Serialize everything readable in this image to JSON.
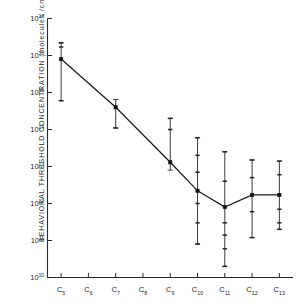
{
  "chart_data": {
    "type": "line",
    "title": "",
    "xlabel": "",
    "ylabel": "BEHAVIORAL THRESHOLD CONCENTRATION  (molecules /cm",
    "ylabel_sup": "3",
    "ylabel_close": ")",
    "grid": false,
    "legend": null,
    "yscale": "log",
    "ylim": [
      10000000000.0,
      1e+17
    ],
    "ytick_labels": [
      "10",
      "10",
      "10",
      "10",
      "10",
      "10",
      "10",
      "10"
    ],
    "ytick_exponents": [
      "17",
      "16",
      "15",
      "14",
      "13",
      "12",
      "11",
      "10"
    ],
    "ytick_values": [
      1e+17,
      1e+16,
      1000000000000000.0,
      100000000000000.0,
      10000000000000.0,
      1000000000000.0,
      100000000000.0,
      10000000000.0
    ],
    "categories": [
      "C",
      "C",
      "C",
      "C",
      "C",
      "C",
      "C",
      "C",
      "C"
    ],
    "category_subscripts": [
      "5",
      "6",
      "7",
      "8",
      "9",
      "10",
      "11",
      "12",
      "13"
    ],
    "category_labels": [
      "C5",
      "C6",
      "C7",
      "8",
      "C9",
      "C10",
      "C11",
      "C12",
      "C13"
    ],
    "series": [
      {
        "name": "behavioral threshold",
        "marker": "square",
        "color": "#1a1a1a",
        "points": [
          {
            "x": "C5",
            "y": 8000000000000000.0,
            "err_low": 600000000000000.0,
            "err_high": 2.2e+16,
            "has_marker": true,
            "ticks": [
              8000000000000000.0,
              1.7e+16,
              2.2e+16,
              600000000000000.0
            ]
          },
          {
            "x": "C6",
            "y": null,
            "err_low": null,
            "err_high": null,
            "has_marker": false,
            "ticks": []
          },
          {
            "x": "C7",
            "y": 400000000000000.0,
            "err_low": 110000000000000.0,
            "err_high": 650000000000000.0,
            "has_marker": true,
            "ticks": [
              400000000000000.0,
              110000000000000.0
            ]
          },
          {
            "x": "C8",
            "y": null,
            "err_low": null,
            "err_high": null,
            "has_marker": false,
            "ticks": []
          },
          {
            "x": "C9",
            "y": 13000000000000.0,
            "err_low": 8000000000000.0,
            "err_high": 200000000000000.0,
            "has_marker": true,
            "ticks": [
              13000000000000.0,
              100000000000000.0,
              200000000000000.0
            ]
          },
          {
            "x": "C10",
            "y": 2200000000000.0,
            "err_low": 80000000000.0,
            "err_high": 60000000000000.0,
            "has_marker": true,
            "ticks": [
              2200000000000.0,
              60000000000000.0,
              20000000000000.0,
              7000000000000.0,
              1000000000000.0,
              300000000000.0,
              80000000000.0
            ]
          },
          {
            "x": "C11",
            "y": 800000000000.0,
            "err_low": 20000000000.0,
            "err_high": 25000000000000.0,
            "has_marker": true,
            "ticks": [
              800000000000.0,
              25000000000000.0,
              4000000000000.0,
              300000000000.0,
              140000000000.0,
              60000000000.0,
              20000000000.0
            ]
          },
          {
            "x": "C12",
            "y": 1700000000000.0,
            "err_low": 120000000000.0,
            "err_high": 15000000000000.0,
            "has_marker": true,
            "ticks": [
              1700000000000.0,
              15000000000000.0,
              5000000000000.0,
              600000000000.0,
              120000000000.0
            ]
          },
          {
            "x": "C13",
            "y": 1700000000000.0,
            "err_low": 200000000000.0,
            "err_high": 14000000000000.0,
            "has_marker": true,
            "ticks": [
              1700000000000.0,
              14000000000000.0,
              6000000000000.0,
              700000000000.0,
              300000000000.0,
              200000000000.0
            ]
          }
        ],
        "connected": [
          "C5",
          "C7",
          "C9",
          "C10",
          "C11",
          "C12",
          "C13"
        ]
      }
    ]
  }
}
